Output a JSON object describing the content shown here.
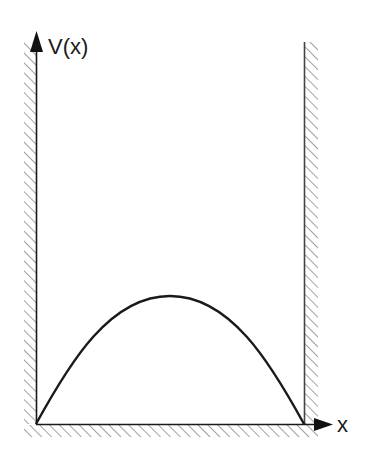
{
  "diagram": {
    "y_axis_label": "V(x)",
    "x_axis_label": "x",
    "colors": {
      "line": "#1a1a1a",
      "hatch": "#888888",
      "background": "#ffffff"
    }
  }
}
